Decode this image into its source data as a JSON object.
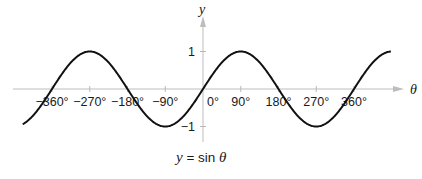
{
  "chart_data": {
    "type": "line",
    "title": "",
    "caption": {
      "lhs": "y",
      "eq": " = ",
      "fn": "sin ",
      "arg": "θ"
    },
    "xlabel": "θ",
    "ylabel": "y",
    "xlim": [
      -430,
      448
    ],
    "ylim": [
      -1,
      1
    ],
    "grid": false,
    "x_ticks": [
      -360,
      -270,
      -180,
      -90,
      0,
      90,
      180,
      270,
      360
    ],
    "x_tick_labels": [
      "−360°",
      "−270°",
      "−180°",
      "−90°",
      "0°",
      "90°",
      "180°",
      "270°",
      "360°"
    ],
    "y_ticks": [
      1,
      -1
    ],
    "y_tick_labels": [
      "1",
      "−1"
    ],
    "series": [
      {
        "name": "y = sin θ",
        "function": "sin",
        "x": [
          -430,
          -360,
          -270,
          -180,
          -90,
          0,
          90,
          180,
          270,
          360,
          448
        ],
        "values": [
          -0.94,
          0,
          1,
          0,
          -1,
          0,
          1,
          0,
          -1,
          0,
          1.0
        ]
      }
    ],
    "colors": {
      "curve": "#111111",
      "axis": "#b8b8b8",
      "text": "#1a1a1a"
    }
  }
}
